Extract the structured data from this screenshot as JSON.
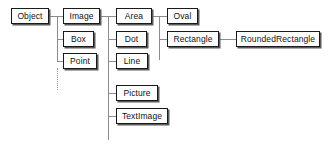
{
  "diagram": {
    "accent_color": "#1a1a1a",
    "edge_color": "#8c8c8c",
    "box_fill": "#ffffff",
    "nodes": [
      {
        "id": "object",
        "label": "Object",
        "x": 11,
        "y": 8,
        "w": 38,
        "h": 16
      },
      {
        "id": "image",
        "label": "Image",
        "x": 63,
        "y": 8,
        "w": 37,
        "h": 16
      },
      {
        "id": "box",
        "label": "Box",
        "x": 63,
        "y": 31,
        "w": 31,
        "h": 16
      },
      {
        "id": "point",
        "label": "Point",
        "x": 63,
        "y": 53,
        "w": 34,
        "h": 16
      },
      {
        "id": "area",
        "label": "Area",
        "x": 116,
        "y": 8,
        "w": 36,
        "h": 16
      },
      {
        "id": "dot",
        "label": "Dot",
        "x": 116,
        "y": 31,
        "w": 31,
        "h": 16
      },
      {
        "id": "line",
        "label": "Line",
        "x": 116,
        "y": 53,
        "w": 32,
        "h": 16
      },
      {
        "id": "picture",
        "label": "Picture",
        "x": 116,
        "y": 85,
        "w": 42,
        "h": 16
      },
      {
        "id": "textimage",
        "label": "TextImage",
        "x": 116,
        "y": 108,
        "w": 52,
        "h": 16
      },
      {
        "id": "oval",
        "label": "Oval",
        "x": 167,
        "y": 8,
        "w": 31,
        "h": 16
      },
      {
        "id": "rectangle",
        "label": "Rectangle",
        "x": 167,
        "y": 31,
        "w": 52,
        "h": 16
      },
      {
        "id": "roundedrectangle",
        "label": "RoundedRectangle",
        "x": 236,
        "y": 31,
        "w": 84,
        "h": 16
      }
    ],
    "edges": [
      {
        "id": "object-stem",
        "type": "h",
        "x": 49,
        "y": 16,
        "len": 9
      },
      {
        "id": "object-trunk",
        "type": "v",
        "x": 57,
        "y": 16,
        "len": 46
      },
      {
        "id": "object-trunk-dash",
        "type": "dotted-v",
        "x": 57,
        "y": 68,
        "len": 22
      },
      {
        "id": "object-to-image",
        "type": "h",
        "x": 57,
        "y": 16,
        "len": 7
      },
      {
        "id": "object-to-box",
        "type": "h",
        "x": 57,
        "y": 39,
        "len": 7
      },
      {
        "id": "object-to-point",
        "type": "h",
        "x": 57,
        "y": 61,
        "len": 7
      },
      {
        "id": "image-stem",
        "type": "h",
        "x": 100,
        "y": 16,
        "len": 9
      },
      {
        "id": "image-trunk",
        "type": "v",
        "x": 108,
        "y": 16,
        "len": 124
      },
      {
        "id": "image-to-area",
        "type": "h",
        "x": 108,
        "y": 16,
        "len": 9
      },
      {
        "id": "image-to-dot",
        "type": "h",
        "x": 108,
        "y": 39,
        "len": 9
      },
      {
        "id": "image-to-line",
        "type": "h",
        "x": 108,
        "y": 61,
        "len": 9
      },
      {
        "id": "image-to-picture",
        "type": "h",
        "x": 108,
        "y": 93,
        "len": 9
      },
      {
        "id": "image-to-textimage",
        "type": "h",
        "x": 108,
        "y": 116,
        "len": 9
      },
      {
        "id": "area-stem",
        "type": "h",
        "x": 152,
        "y": 16,
        "len": 8
      },
      {
        "id": "area-trunk",
        "type": "v",
        "x": 159,
        "y": 16,
        "len": 44
      },
      {
        "id": "area-to-oval",
        "type": "h",
        "x": 159,
        "y": 16,
        "len": 9
      },
      {
        "id": "area-to-rectangle",
        "type": "h",
        "x": 159,
        "y": 39,
        "len": 9
      },
      {
        "id": "rect-to-rounded",
        "type": "h",
        "x": 219,
        "y": 39,
        "len": 18
      }
    ]
  }
}
